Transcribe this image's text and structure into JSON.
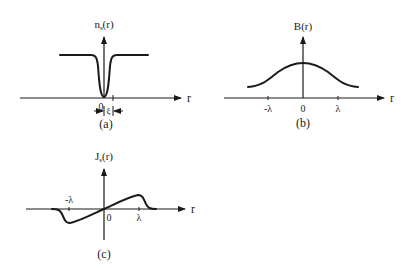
{
  "panels": {
    "a": {
      "caption": "(a)",
      "y_label": "n",
      "y_label_sub": "s",
      "y_label_tail": "(r)",
      "x_label": "r",
      "origin_label": "0",
      "width_label": "ξ"
    },
    "b": {
      "caption": "(b)",
      "y_label": "B(r)",
      "x_label": "r",
      "ticks": [
        "-λ",
        "0",
        "λ"
      ]
    },
    "c": {
      "caption": "(c)",
      "y_label": "J",
      "y_label_sub": "s",
      "y_label_tail": "(r)",
      "x_label": "r",
      "ticks": [
        "-λ",
        "0",
        "λ"
      ]
    }
  },
  "colors": {
    "ink": "#1a1a1a",
    "background": "#ffffff"
  }
}
